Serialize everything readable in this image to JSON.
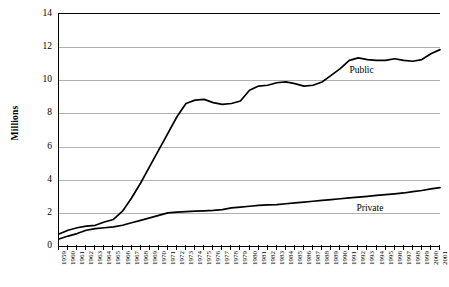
{
  "chart_data": {
    "type": "line",
    "title": "",
    "xlabel": "",
    "ylabel": "Millions",
    "ylim": [
      0,
      14
    ],
    "yticks": [
      0,
      2,
      4,
      6,
      8,
      10,
      12,
      14
    ],
    "grid": true,
    "legend_position": "inline",
    "x": [
      1959,
      1960,
      1961,
      1962,
      1963,
      1964,
      1965,
      1966,
      1967,
      1968,
      1969,
      1970,
      1971,
      1972,
      1973,
      1974,
      1975,
      1976,
      1977,
      1978,
      1979,
      1980,
      1981,
      1982,
      1983,
      1984,
      1985,
      1986,
      1987,
      1988,
      1989,
      1990,
      1991,
      1992,
      1993,
      1994,
      1995,
      1996,
      1997,
      1998,
      1999,
      2000,
      2001
    ],
    "series": [
      {
        "name": "Public",
        "label": "Public",
        "color": "#000000",
        "values": [
          0.72,
          0.95,
          1.1,
          1.2,
          1.25,
          1.45,
          1.6,
          2.1,
          2.9,
          3.8,
          4.8,
          5.8,
          6.8,
          7.8,
          8.6,
          8.8,
          8.85,
          8.65,
          8.55,
          8.6,
          8.75,
          9.4,
          9.65,
          9.7,
          9.85,
          9.9,
          9.8,
          9.65,
          9.7,
          9.9,
          10.3,
          10.7,
          11.2,
          11.35,
          11.25,
          11.2,
          11.2,
          11.3,
          11.2,
          11.15,
          11.25,
          11.6,
          11.85
        ]
      },
      {
        "name": "Private",
        "label": "Private",
        "color": "#000000",
        "values": [
          0.42,
          0.6,
          0.75,
          0.95,
          1.05,
          1.1,
          1.15,
          1.25,
          1.4,
          1.55,
          1.7,
          1.85,
          2.0,
          2.05,
          2.08,
          2.1,
          2.12,
          2.15,
          2.2,
          2.3,
          2.35,
          2.4,
          2.45,
          2.48,
          2.5,
          2.55,
          2.6,
          2.65,
          2.7,
          2.75,
          2.8,
          2.85,
          2.9,
          2.95,
          3.0,
          3.05,
          3.1,
          3.15,
          3.2,
          3.28,
          3.35,
          3.45,
          3.52
        ]
      }
    ]
  }
}
